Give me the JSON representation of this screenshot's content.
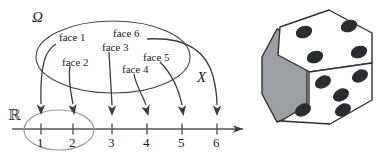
{
  "figure": {
    "sample_space_label": "Ω",
    "mapping_label": "X",
    "codomain_label": "ℝ",
    "outcome_labels": [
      {
        "id": "face-1",
        "text": "face 1",
        "maps_to": 1
      },
      {
        "id": "face-2",
        "text": "face 2",
        "maps_to": 2
      },
      {
        "id": "face-3",
        "text": "face 3",
        "maps_to": 3
      },
      {
        "id": "face-4",
        "text": "face 4",
        "maps_to": 4
      },
      {
        "id": "face-5",
        "text": "face 5",
        "maps_to": 5
      },
      {
        "id": "face-6",
        "text": "face 6",
        "maps_to": 6
      }
    ],
    "number_line": {
      "ticks": [
        "1",
        "2",
        "3",
        "4",
        "5",
        "6"
      ],
      "highlighted_ticks": [
        "1",
        "2"
      ]
    },
    "die": {
      "name": "six-sided-die",
      "top_face_pips": 4,
      "right_face_pips": 5,
      "left_face_shaded": true
    },
    "colors": {
      "ink": "#1c1c1c",
      "line": "#44464a",
      "axis": "#55575b",
      "highlight_ellipse": "#9a9ca0",
      "die_shadow": "#9d9fa3",
      "pip": "#2a2c2f"
    }
  }
}
